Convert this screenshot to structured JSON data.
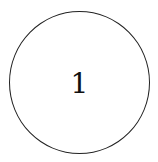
{
  "diagram": {
    "node": {
      "label": "1",
      "stroke_color": "#222222",
      "fill_color": "#ffffff"
    }
  }
}
